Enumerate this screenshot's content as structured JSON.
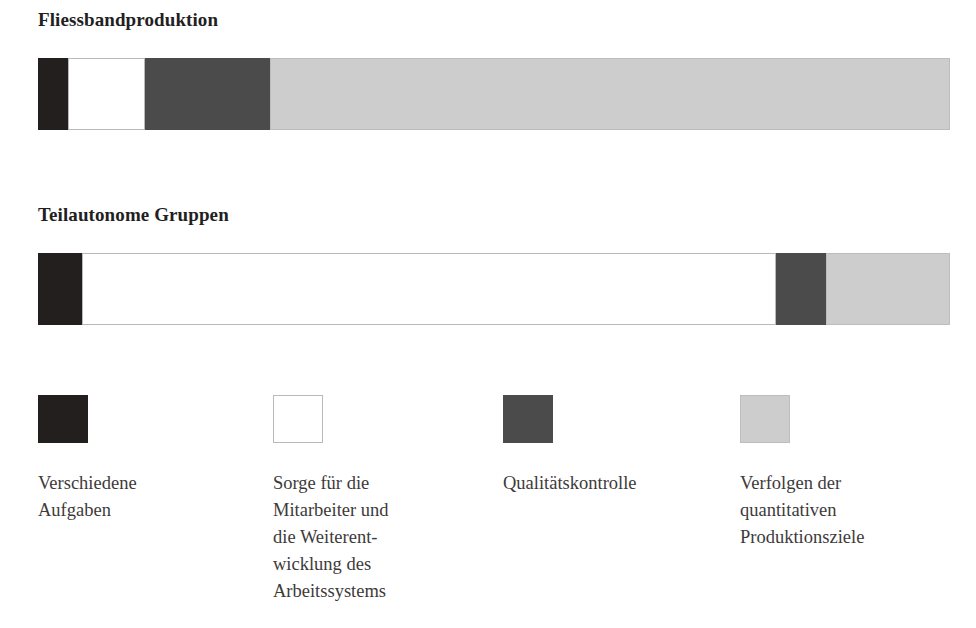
{
  "chart_data": {
    "type": "bar",
    "title": "",
    "orientation": "horizontal",
    "stacked": true,
    "units": "percent of working time",
    "xlabel": "",
    "ylabel": "",
    "xlim": [
      0,
      100
    ],
    "grid": false,
    "legend_position": "bottom",
    "categories": [
      "Fliessbandproduktion",
      "Teilautonome Gruppen"
    ],
    "series": [
      {
        "name": "Verschiedene Aufgaben",
        "color": "#231f1f",
        "values": [
          3.3,
          4.8
        ]
      },
      {
        "name": "Sorge für die Mitarbeiter und die Weiterentwicklung des Arbeitssystems",
        "color": "#ffffff",
        "values": [
          8.4,
          76.1
        ]
      },
      {
        "name": "Qualitätskontrolle",
        "color": "#4b4b4b",
        "values": [
          13.7,
          5.5
        ]
      },
      {
        "name": "Verfolgen der quantitativen Produktionsziele",
        "color": "#cdcdcd",
        "values": [
          74.6,
          13.6
        ]
      }
    ]
  },
  "bars": [
    {
      "title": "Fliessbandproduktion",
      "segments": [
        {
          "key": "verschiedene-aufgaben",
          "swatch": "seg-black",
          "percent": 3.3
        },
        {
          "key": "sorge-mitarbeiter",
          "swatch": "seg-white",
          "percent": 8.4
        },
        {
          "key": "qualitaetskontrolle",
          "swatch": "seg-darkgray",
          "percent": 13.7
        },
        {
          "key": "produktionsziele",
          "swatch": "seg-lightgray",
          "percent": 74.6
        }
      ]
    },
    {
      "title": "Teilautonome Gruppen",
      "segments": [
        {
          "key": "verschiedene-aufgaben",
          "swatch": "seg-black",
          "percent": 4.8
        },
        {
          "key": "sorge-mitarbeiter",
          "swatch": "seg-white",
          "percent": 76.1
        },
        {
          "key": "qualitaetskontrolle",
          "swatch": "seg-darkgray",
          "percent": 5.5
        },
        {
          "key": "produktionsziele",
          "swatch": "seg-lightgray",
          "percent": 13.6
        }
      ]
    }
  ],
  "legend": {
    "items": [
      {
        "key": "verschiedene-aufgaben",
        "swatch": "seg-black",
        "color": "#231f1f",
        "label": "Verschiedene\nAufgaben"
      },
      {
        "key": "sorge-mitarbeiter",
        "swatch": "seg-white",
        "color": "#ffffff",
        "label": "Sorge für die\nMitarbeiter und\ndie Weiterent-\nwicklung des\nArbeitssystems"
      },
      {
        "key": "qualitaetskontrolle",
        "swatch": "seg-darkgray",
        "color": "#4b4b4b",
        "label": "Qualitätskontrolle"
      },
      {
        "key": "produktionsziele",
        "swatch": "seg-lightgray",
        "color": "#cdcdcd",
        "label": "Verfolgen der\nquantitativen\nProduktionsziele"
      }
    ]
  }
}
